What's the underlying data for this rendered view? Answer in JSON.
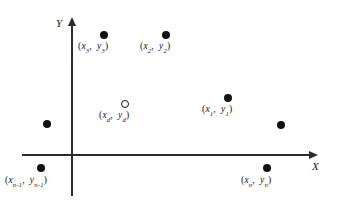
{
  "figure": {
    "type": "scatter-diagram",
    "background_color": "#ffffff",
    "axis_color": "#2b2b2b",
    "point_color": "#111111"
  },
  "axes": {
    "x_label": "X",
    "y_label": "Y",
    "origin_px": {
      "x": 72,
      "y": 155
    },
    "x_axis_px": {
      "start_x": 22,
      "end_x": 318,
      "y": 155
    },
    "y_axis_px": {
      "x": 72,
      "top_y": 17,
      "bottom_y": 196
    }
  },
  "points": [
    {
      "id": "p3",
      "marker": "filled",
      "px": {
        "x": 104,
        "y": 35
      },
      "label_parts": {
        "x_var": "x",
        "x_sub": "3",
        "y_var": "y",
        "y_sub": "3"
      },
      "label_px": {
        "x": 78,
        "y": 42
      }
    },
    {
      "id": "p2",
      "marker": "filled",
      "px": {
        "x": 166,
        "y": 35
      },
      "label_parts": {
        "x_var": "x",
        "x_sub": "2",
        "y_var": "y",
        "y_sub": "2"
      },
      "label_px": {
        "x": 140,
        "y": 42
      }
    },
    {
      "id": "pd",
      "marker": "open",
      "px": {
        "x": 125,
        "y": 104
      },
      "label_parts": {
        "x_var": "x",
        "x_sub": "d",
        "y_var": "y",
        "y_sub": "d"
      },
      "label_px": {
        "x": 99,
        "y": 111
      }
    },
    {
      "id": "p1",
      "marker": "filled",
      "px": {
        "x": 228,
        "y": 98
      },
      "label_parts": {
        "x_var": "x",
        "x_sub": "1",
        "y_var": "y",
        "y_sub": "1"
      },
      "label_px": {
        "x": 202,
        "y": 105
      }
    },
    {
      "id": "p-left-unlabeled",
      "marker": "filled",
      "px": {
        "x": 47,
        "y": 124
      },
      "label_parts": null,
      "label_px": null
    },
    {
      "id": "p-right-unlabeled",
      "marker": "filled",
      "px": {
        "x": 281,
        "y": 125
      },
      "label_parts": null,
      "label_px": null
    },
    {
      "id": "pn-1",
      "marker": "filled",
      "px": {
        "x": 41,
        "y": 168
      },
      "label_parts": {
        "x_var": "x",
        "x_sub": "n-1",
        "y_var": "y",
        "y_sub": "n-1"
      },
      "label_px": {
        "x": 5,
        "y": 176
      }
    },
    {
      "id": "pn",
      "marker": "filled",
      "px": {
        "x": 267,
        "y": 168
      },
      "label_parts": {
        "x_var": "x",
        "x_sub": "n",
        "y_var": "y",
        "y_sub": "n"
      },
      "label_px": {
        "x": 241,
        "y": 176
      }
    }
  ],
  "label_syntax": {
    "open_paren": "(",
    "close_paren": ")",
    "separator": ","
  }
}
